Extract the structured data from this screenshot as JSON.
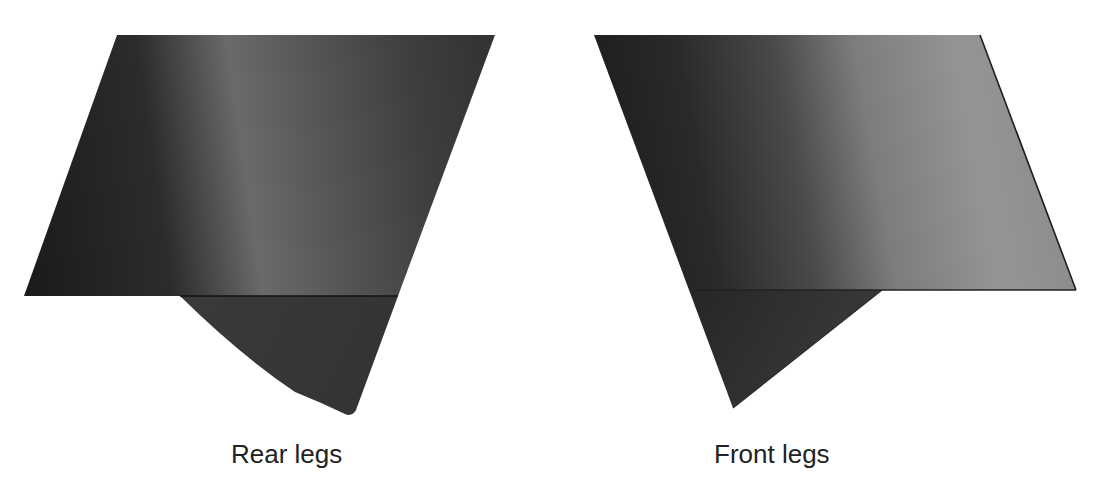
{
  "figure": {
    "panels": [
      {
        "id": "rear",
        "caption": "Rear legs",
        "colors": {
          "dark": "#1f1f1f",
          "highlight": "#6e6e6e",
          "mid": "#3c3c3c",
          "flap": "#3a3a3a",
          "edge": "#1a1a1a"
        }
      },
      {
        "id": "front",
        "caption": "Front legs",
        "colors": {
          "dark": "#1f1f1f",
          "light": "#9a9a9a",
          "flap": "#383838",
          "edge": "#1a1a1a"
        }
      }
    ]
  }
}
